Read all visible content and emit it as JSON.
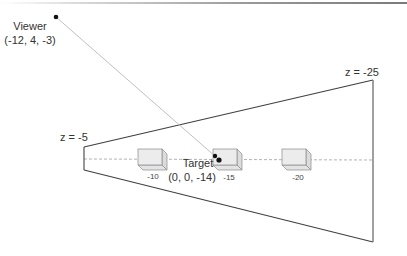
{
  "diagram": {
    "colors": {
      "frustum_edge": "#404040",
      "far_plane_edge": "#808080",
      "center_line": "#a0a0a0",
      "sight_line": "#b8b8b8",
      "box_fill": "#ececec",
      "box_side": "#dcdcdc",
      "box_edge": "#8a8a8a",
      "point": "#111111",
      "text": "#333333"
    },
    "viewer": {
      "name": "Viewer",
      "coords": "(-12, 4, -3)"
    },
    "target": {
      "name": "Target",
      "coords": "(0, 0, -14)"
    },
    "planes": {
      "near_label": "z = -5",
      "far_label": "z = -25"
    },
    "objects": [
      {
        "label": "-10"
      },
      {
        "label": "-15"
      },
      {
        "label": "-20"
      }
    ]
  }
}
